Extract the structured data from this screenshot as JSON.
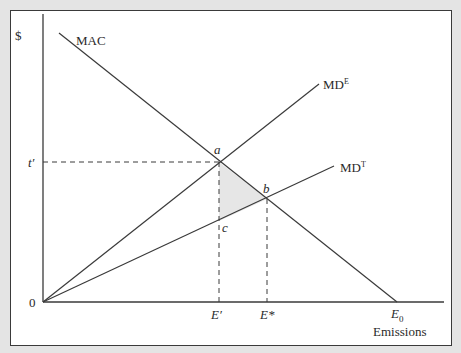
{
  "diagram": {
    "y_axis_label": "$",
    "x_axis_label": "Emissions",
    "origin_label": "0",
    "curves": [
      {
        "name": "MAC",
        "label": "MAC",
        "superscript": ""
      },
      {
        "name": "MD_E",
        "label": "MD",
        "superscript": "E"
      },
      {
        "name": "MD_T",
        "label": "MD",
        "superscript": "T"
      }
    ],
    "points": [
      {
        "name": "a",
        "label": "a"
      },
      {
        "name": "b",
        "label": "b"
      },
      {
        "name": "c",
        "label": "c"
      }
    ],
    "y_ticks": [
      {
        "label": "t′"
      }
    ],
    "x_ticks": [
      {
        "label": "E′"
      },
      {
        "label": "E*"
      },
      {
        "label": "E",
        "subscript": "0"
      }
    ],
    "shaded_region": "triangle abc",
    "colors": {
      "background": "#e4e4e4",
      "panel": "#ffffff",
      "line": "#3a3a3a",
      "shade": "#e6e6e6"
    }
  }
}
